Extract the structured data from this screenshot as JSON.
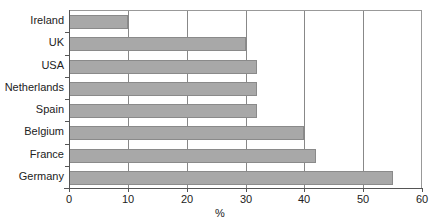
{
  "chart_data": {
    "type": "bar",
    "orientation": "horizontal",
    "title": "",
    "categories": [
      "Ireland",
      "UK",
      "USA",
      "Netherlands",
      "Spain",
      "Belgium",
      "France",
      "Germany"
    ],
    "values": [
      10,
      30,
      32,
      32,
      32,
      40,
      42,
      55
    ],
    "xlabel": "%",
    "ylabel": "",
    "xlim": [
      0,
      60
    ],
    "xticks": [
      "0",
      "10",
      "20",
      "30",
      "40",
      "50",
      "60"
    ],
    "grid": "vertical",
    "legend": null,
    "bar_color": "#a8a8a8"
  }
}
